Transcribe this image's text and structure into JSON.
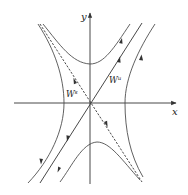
{
  "diagram": {
    "axes": {
      "x_label": "x",
      "y_label": "y"
    },
    "manifolds": {
      "unstable": {
        "label": "W",
        "superscript": "u",
        "style": "solid"
      },
      "stable": {
        "label": "W",
        "superscript": "s",
        "style": "dashed"
      }
    },
    "colors": {
      "line": "#333333",
      "background": "#ffffff"
    }
  }
}
